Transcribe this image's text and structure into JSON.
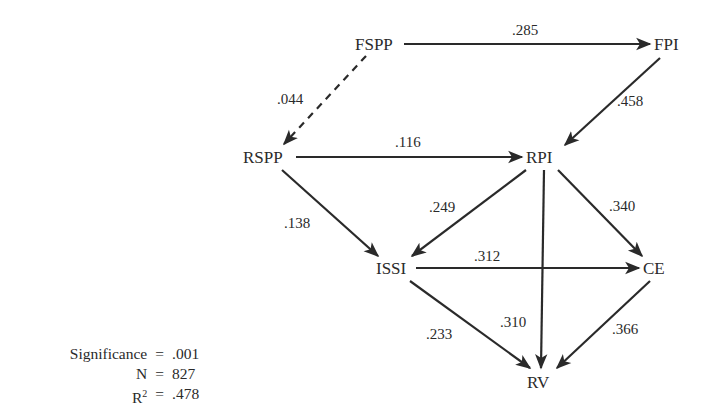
{
  "diagram": {
    "type": "path-diagram",
    "nodes": [
      {
        "id": "FSPP",
        "label": "FSPP",
        "x": 378,
        "y": 46
      },
      {
        "id": "FPI",
        "label": "FPI",
        "x": 670,
        "y": 46
      },
      {
        "id": "RSPP",
        "label": "RSPP",
        "x": 268,
        "y": 158
      },
      {
        "id": "RPI",
        "label": "RPI",
        "x": 543,
        "y": 158
      },
      {
        "id": "ISSI",
        "label": "ISSI",
        "x": 393,
        "y": 268
      },
      {
        "id": "CE",
        "label": "CE",
        "x": 657,
        "y": 268
      },
      {
        "id": "RV",
        "label": "RV",
        "x": 543,
        "y": 382
      }
    ],
    "edges": [
      {
        "from": "FSPP",
        "to": "FPI",
        "coef": ".285",
        "style": "solid"
      },
      {
        "from": "FSPP",
        "to": "RSPP",
        "coef": ".044",
        "style": "dashed"
      },
      {
        "from": "FPI",
        "to": "RPI",
        "coef": ".458",
        "style": "solid"
      },
      {
        "from": "RSPP",
        "to": "RPI",
        "coef": ".116",
        "style": "solid"
      },
      {
        "from": "RSPP",
        "to": "ISSI",
        "coef": ".138",
        "style": "solid"
      },
      {
        "from": "RPI",
        "to": "ISSI",
        "coef": ".249",
        "style": "solid"
      },
      {
        "from": "RPI",
        "to": "CE",
        "coef": ".340",
        "style": "solid"
      },
      {
        "from": "RPI",
        "to": "RV",
        "coef": ".310",
        "style": "solid"
      },
      {
        "from": "ISSI",
        "to": "CE",
        "coef": ".312",
        "style": "solid"
      },
      {
        "from": "ISSI",
        "to": "RV",
        "coef": ".233",
        "style": "solid"
      },
      {
        "from": "CE",
        "to": "RV",
        "coef": ".366",
        "style": "solid"
      }
    ]
  },
  "stats": {
    "significance_label": "Significance",
    "significance_value": ".001",
    "n_label": "N",
    "n_value": "827",
    "r2_label": "R",
    "r2_sup": "2",
    "r2_value": ".478",
    "equals": "="
  },
  "colors": {
    "ink": "#2a2a2a",
    "background": "#ffffff"
  }
}
